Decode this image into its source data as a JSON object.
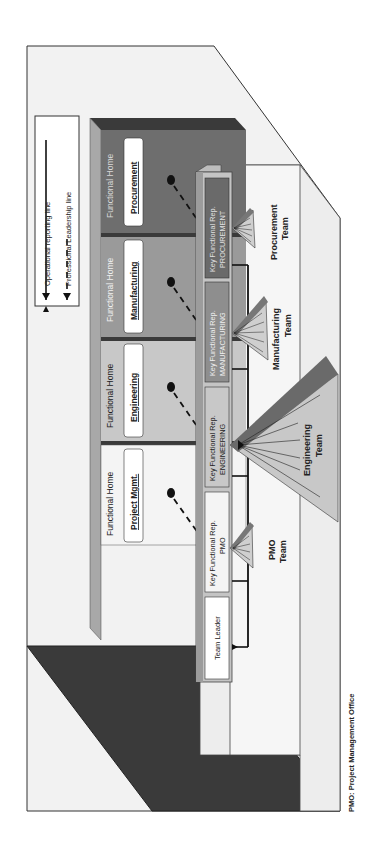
{
  "legend": {
    "solid_label": "Operational reporting line",
    "dashed_label": "Professional Leadership line"
  },
  "functional_homes": [
    {
      "title": "Functional Home",
      "name": "Procurement",
      "color": "#6e6e6e",
      "text_color": "#d8d8d8"
    },
    {
      "title": "Functional Home",
      "name": "Manufacturing",
      "color": "#9a9a9a",
      "text_color": "#f0f0f0"
    },
    {
      "title": "Functional Home",
      "name": "Engineering",
      "color": "#c8c8c8",
      "text_color": "#222222"
    },
    {
      "title": "Functional Home",
      "name": "Project Mgmt.",
      "color": "#f4f4f4",
      "text_color": "#222222"
    }
  ],
  "team_bar": {
    "leader": "Team Leader",
    "reps": [
      {
        "line1": "Key Functional Rep.",
        "line2": "PMO",
        "color": "#f4f4f4",
        "text_color": "#222222"
      },
      {
        "line1": "Key Functional Rep.",
        "line2": "ENGINEERING",
        "color": "#c8c8c8",
        "text_color": "#222222"
      },
      {
        "line1": "Key Functional Rep.",
        "line2": "MANUFACTURING",
        "color": "#8e8e8e",
        "text_color": "#f0f0f0"
      },
      {
        "line1": "Key Functional Rep.",
        "line2": "PROCUREMENT",
        "color": "#6a6a6a",
        "text_color": "#e0e0e0"
      }
    ]
  },
  "teams": [
    {
      "line1": "PMO",
      "line2": "Team"
    },
    {
      "line1": "Engineering",
      "line2": "Team"
    },
    {
      "line1": "Manufacturing",
      "line2": "Team"
    },
    {
      "line1": "Procurement",
      "line2": "Team"
    }
  ],
  "footnote": "PMO: Project Management Office",
  "colors": {
    "floor_dark": "#3a3a3a",
    "wall_light": "#f4f4f4",
    "outline": "#333333"
  }
}
